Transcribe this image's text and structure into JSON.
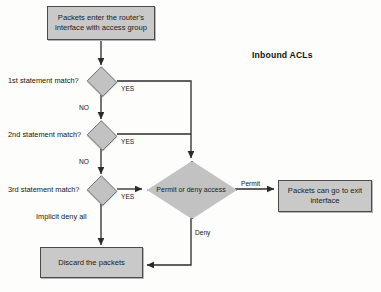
{
  "diagram": {
    "title": "Inbound ACLs",
    "type": "flowchart",
    "nodes": {
      "entry": {
        "line1": "Packets enter the router's",
        "line2": "interface with access group"
      },
      "decision1": "1st statement match?",
      "decision2": "2nd statement match?",
      "decision3": "3rd statement match?",
      "permit_deny": {
        "line1": "Permit or",
        "line2": "deny access"
      },
      "exit": {
        "line1": "Packets can go to exit",
        "line2": "interface"
      },
      "discard": "Discard the packets"
    },
    "edge_labels": {
      "yes1": "YES",
      "yes2": "YES",
      "yes3": "YES",
      "no1": "NO",
      "no2": "NO",
      "implicit_deny": "Implicit deny all",
      "permit": "Permit",
      "deny": "Deny"
    },
    "colors": {
      "node_fill": "#c9c9c9",
      "node_stroke": "#4a4a4a",
      "line": "#2b2b2b",
      "background": "#fdfdfc"
    }
  }
}
